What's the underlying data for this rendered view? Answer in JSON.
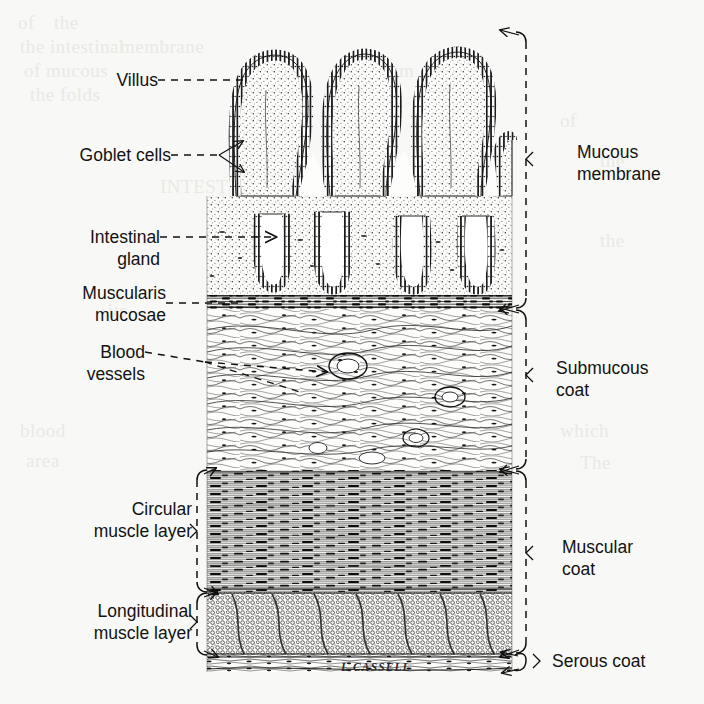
{
  "figure": {
    "signature": "L.CASSELL",
    "background_color": "#f8f8f6",
    "ink_color": "#111111"
  },
  "left_labels": [
    {
      "id": "villus",
      "text": "Villus",
      "leader": "dashed"
    },
    {
      "id": "goblet-cells",
      "text": "Goblet cells",
      "leader": "dashed-fork"
    },
    {
      "id": "intestinal-gland",
      "text": "Intestinal\ngland",
      "leader": "dashed"
    },
    {
      "id": "muscularis-mucosae",
      "text": "Muscularis\nmucosae",
      "leader": "dashed"
    },
    {
      "id": "blood-vessels",
      "text": "Blood\nvessels",
      "leader": "dashed-fork"
    },
    {
      "id": "circular-muscle",
      "text": "Circular\nmuscle layer",
      "leader": "bracket"
    },
    {
      "id": "longitudinal-muscle",
      "text": "Longitudinal\nmuscle layer",
      "leader": "bracket"
    }
  ],
  "right_labels": [
    {
      "id": "mucous-membrane",
      "text": "Mucous\nmembrane",
      "leader": "bracket"
    },
    {
      "id": "submucous-coat",
      "text": "Submucous\ncoat",
      "leader": "bracket"
    },
    {
      "id": "muscular-coat",
      "text": "Muscular\ncoat",
      "leader": "bracket"
    },
    {
      "id": "serous-coat",
      "text": "Serous coat",
      "leader": "bracket"
    }
  ],
  "layers": [
    {
      "id": "mucous-membrane",
      "name": "Mucous membrane",
      "top": 30,
      "bottom": 308
    },
    {
      "id": "submucous-coat",
      "name": "Submucous coat",
      "top": 308,
      "bottom": 470
    },
    {
      "id": "circular-muscle",
      "name": "Circular muscle layer",
      "top": 470,
      "bottom": 592
    },
    {
      "id": "longitudinal-muscle",
      "name": "Longitudinal muscle layer",
      "top": 592,
      "bottom": 655
    },
    {
      "id": "serous-coat",
      "name": "Serous coat",
      "top": 655,
      "bottom": 672
    }
  ],
  "ghost_text": [
    {
      "text": "of ",
      "x": 18,
      "y": 12
    },
    {
      "text": "the ",
      "x": 54,
      "y": 12
    },
    {
      "text": "the intestinal",
      "x": 20,
      "y": 36
    },
    {
      "text": "of mucous",
      "x": 24,
      "y": 60
    },
    {
      "text": "the folds",
      "x": 30,
      "y": 84
    },
    {
      "text": "membrane",
      "x": 120,
      "y": 36
    },
    {
      "text": "INTESTINE",
      "x": 160,
      "y": 176
    },
    {
      "text": "duodenum",
      "x": 330,
      "y": 60
    },
    {
      "text": "in the",
      "x": 420,
      "y": 84
    },
    {
      "text": "of",
      "x": 560,
      "y": 110
    },
    {
      "text": "the",
      "x": 600,
      "y": 150
    },
    {
      "text": "blood",
      "x": 20,
      "y": 420
    },
    {
      "text": "area",
      "x": 26,
      "y": 450
    },
    {
      "text": "which",
      "x": 560,
      "y": 420
    },
    {
      "text": "The",
      "x": 580,
      "y": 452
    },
    {
      "text": "the",
      "x": 600,
      "y": 230
    },
    {
      "text": "its",
      "x": 108,
      "y": 300
    }
  ]
}
